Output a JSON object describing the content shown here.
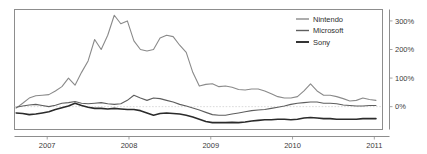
{
  "chart_data": {
    "type": "line",
    "title": "",
    "xlabel": "",
    "ylabel": "",
    "grid": false,
    "legend_position": "top-right",
    "ylim": [
      -80,
      340
    ],
    "xlim": [
      2006.6,
      2011.1
    ],
    "yticks": [
      0,
      100,
      200,
      300
    ],
    "ytick_labels": [
      "0%",
      "100%",
      "200%",
      "300%"
    ],
    "xticks": [
      2007,
      2008,
      2009,
      2010,
      2011
    ],
    "xtick_labels": [
      "2007",
      "2008",
      "2009",
      "2010",
      "2011"
    ],
    "y_axis_position": "right",
    "x": [
      2006.62,
      2006.7,
      2006.78,
      2006.86,
      2006.94,
      2007.02,
      2007.1,
      2007.18,
      2007.26,
      2007.34,
      2007.42,
      2007.5,
      2007.58,
      2007.66,
      2007.74,
      2007.82,
      2007.9,
      2007.98,
      2008.06,
      2008.14,
      2008.22,
      2008.3,
      2008.38,
      2008.46,
      2008.54,
      2008.62,
      2008.7,
      2008.78,
      2008.86,
      2008.94,
      2009.02,
      2009.1,
      2009.18,
      2009.26,
      2009.34,
      2009.42,
      2009.5,
      2009.58,
      2009.66,
      2009.74,
      2009.82,
      2009.9,
      2009.98,
      2010.06,
      2010.14,
      2010.22,
      2010.3,
      2010.38,
      2010.46,
      2010.54,
      2010.62,
      2010.7,
      2010.78,
      2010.86,
      2010.94,
      2011.02
    ],
    "series": [
      {
        "name": "Nintendo",
        "color": "#8a8a8a",
        "width": 1.1,
        "values": [
          -5,
          12,
          30,
          38,
          40,
          42,
          55,
          70,
          100,
          75,
          120,
          160,
          235,
          200,
          250,
          320,
          290,
          300,
          230,
          200,
          195,
          200,
          240,
          250,
          245,
          215,
          190,
          120,
          72,
          78,
          80,
          70,
          72,
          68,
          60,
          58,
          62,
          62,
          55,
          45,
          35,
          30,
          30,
          35,
          55,
          80,
          55,
          40,
          40,
          35,
          28,
          20,
          22,
          30,
          25,
          22
        ]
      },
      {
        "name": "Microsoft",
        "color": "#5e5e5e",
        "width": 1.1,
        "values": [
          -2,
          2,
          6,
          8,
          4,
          0,
          5,
          12,
          14,
          18,
          12,
          10,
          12,
          14,
          10,
          8,
          10,
          22,
          40,
          30,
          22,
          30,
          28,
          22,
          16,
          8,
          2,
          -5,
          -12,
          -20,
          -28,
          -30,
          -30,
          -26,
          -22,
          -18,
          -14,
          -12,
          -10,
          -6,
          -2,
          2,
          8,
          12,
          14,
          16,
          16,
          12,
          12,
          10,
          6,
          4,
          2,
          2,
          4,
          4
        ]
      },
      {
        "name": "Sony",
        "color": "#2b2b2b",
        "width": 1.6,
        "values": [
          -22,
          -24,
          -28,
          -26,
          -22,
          -18,
          -10,
          -4,
          2,
          12,
          4,
          -2,
          -6,
          -6,
          -8,
          -6,
          -8,
          -10,
          -10,
          -14,
          -22,
          -30,
          -24,
          -22,
          -24,
          -26,
          -30,
          -36,
          -44,
          -52,
          -56,
          -56,
          -56,
          -55,
          -56,
          -54,
          -50,
          -48,
          -46,
          -46,
          -44,
          -44,
          -46,
          -44,
          -40,
          -38,
          -40,
          -42,
          -42,
          -44,
          -44,
          -44,
          -44,
          -42,
          -42,
          -42
        ]
      }
    ]
  },
  "legend": {
    "items": [
      {
        "label": "Nintendo"
      },
      {
        "label": "Microsoft"
      },
      {
        "label": "Sony"
      }
    ]
  }
}
